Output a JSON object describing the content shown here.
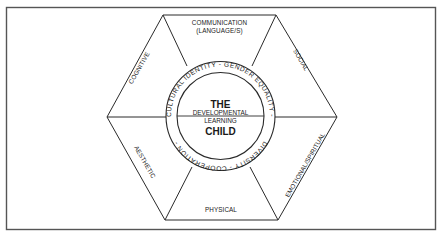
{
  "diagram": {
    "center": {
      "line1": "THE",
      "line2": "DEVELOPMENTAL",
      "line3": "LEARNING",
      "line4": "CHILD"
    },
    "ring_labels": {
      "top": "CULTURAL IDENTITY  -  GENDER EQUALITY  -",
      "bottom": "DIVERSITY  -  COOPERATION  -"
    },
    "segments": {
      "top_line1": "COMMUNICATION",
      "top_line2": "(LANGUAGE/S)",
      "upper_right": "SOCIAL",
      "lower_right": "EMOTIONAL/SPIRITUAL",
      "bottom": "PHYSICAL",
      "lower_left": "AESTHETIC",
      "upper_left": "COGNITIVE"
    },
    "colors": {
      "line": "#2a2a2a",
      "frame": "#555555",
      "background": "#ffffff"
    }
  }
}
